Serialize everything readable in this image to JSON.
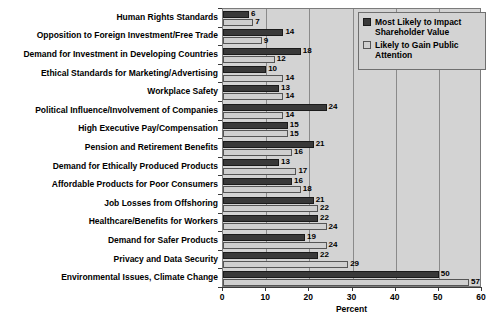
{
  "chart_data": {
    "type": "bar",
    "orientation": "horizontal",
    "title": "",
    "xlabel": "Percent",
    "ylabel": "",
    "xlim": [
      0,
      60
    ],
    "xticks": [
      0,
      10,
      20,
      30,
      40,
      50,
      60
    ],
    "grid": true,
    "legend_position": "top-right",
    "categories": [
      "Human Rights Standards",
      "Opposition to Foreign Investment/Free Trade",
      "Demand for Investment in Developing Countries",
      "Ethical Standards for Marketing/Advertising",
      "Workplace Safety",
      "Political Influence/Involvement of Companies",
      "High Executive Pay/Compensation",
      "Pension and Retirement Benefits",
      "Demand for Ethically Produced Products",
      "Affordable Products for Poor Consumers",
      "Job Losses from Offshoring",
      "Healthcare/Benefits for Workers",
      "Demand for Safer Products",
      "Privacy and Data Security",
      "Environmental Issues, Climate Change"
    ],
    "series": [
      {
        "name": "Most Likely to Impact Shareholder Value",
        "color": "#393939",
        "values": [
          6,
          14,
          18,
          10,
          13,
          24,
          15,
          21,
          13,
          16,
          21,
          22,
          19,
          22,
          50
        ]
      },
      {
        "name": "Likely to Gain Public Attention",
        "color": "#cfcfcf",
        "values": [
          7,
          9,
          12,
          14,
          14,
          14,
          15,
          16,
          17,
          18,
          22,
          24,
          24,
          29,
          57
        ]
      }
    ]
  },
  "legend": {
    "entries": [
      {
        "label": "Most Likely to Impact Shareholder Value",
        "swatch": "dark"
      },
      {
        "label": "Likely to Gain Public Attention",
        "swatch": "light"
      }
    ]
  },
  "axis": {
    "x_title": "Percent",
    "tick_labels": [
      "0",
      "10",
      "20",
      "30",
      "40",
      "50",
      "60"
    ]
  }
}
